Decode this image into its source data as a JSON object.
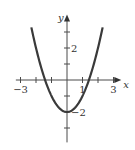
{
  "chart_data": {
    "type": "line",
    "title": "",
    "xlabel": "x",
    "ylabel": "y",
    "function": "y = x^2 - 2",
    "xlim": [
      -3.3,
      3.5
    ],
    "ylim": [
      -3.9,
      4.1
    ],
    "x_ticks": [
      -3,
      -2,
      -1,
      1,
      2,
      3
    ],
    "y_ticks": [
      -3,
      -2,
      -1,
      1,
      2,
      3
    ],
    "x_tick_labels": [
      {
        "value": -3,
        "label": "−3"
      },
      {
        "value": 1,
        "label": "1"
      },
      {
        "value": 3,
        "label": "3"
      }
    ],
    "y_tick_labels": [
      {
        "value": 2,
        "label": "2"
      },
      {
        "value": -2,
        "label": "−2"
      }
    ],
    "series": [
      {
        "name": "parabola",
        "x": [
          -2.3,
          -2.0,
          -1.5,
          -1.0,
          -0.5,
          0,
          0.5,
          1.0,
          1.5,
          2.0,
          2.3
        ],
        "y": [
          3.29,
          2.0,
          0.25,
          -1.0,
          -1.75,
          -2.0,
          -1.75,
          -1.0,
          0.25,
          2.0,
          3.29
        ]
      }
    ],
    "grid": false,
    "legend": "none"
  }
}
